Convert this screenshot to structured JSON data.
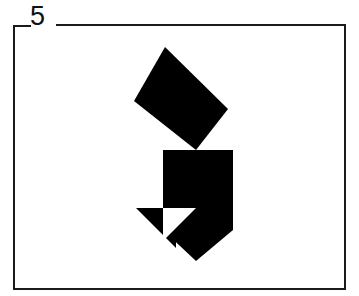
{
  "figure": {
    "label": "5",
    "caption_position": "top-left-inset",
    "frame": {
      "present": true,
      "color": "#1a1a1a",
      "stroke_width": 2,
      "left": 13,
      "top": 24,
      "right": 346,
      "bottom": 290,
      "top_gap_for_label": true
    },
    "background_color": "#ffffff",
    "shape_color": "#000000",
    "shape_kind": "tangram-silhouette",
    "pieces": [
      {
        "name": "large-rotated-rectangle",
        "type": "parallelogram",
        "points": "165,47 228,109 196,150 134,101",
        "fill": "#000000"
      },
      {
        "name": "upper-right-square",
        "type": "quadrilateral",
        "points": "196,150 233,150 233,186 196,186",
        "fill": "#000000"
      },
      {
        "name": "central-body",
        "type": "polygon",
        "points": "196,150 196,186 233,186 233,230 196,261 163,230 163,186 163,150",
        "fill": "#000000"
      },
      {
        "name": "left-lower-triangle",
        "type": "triangle",
        "points": "136,208 176,208 176,248",
        "fill": "#000000"
      },
      {
        "name": "white-notch-triangle",
        "type": "triangle",
        "points": "163,208 196,208 163,241",
        "fill": "#ffffff"
      }
    ]
  }
}
